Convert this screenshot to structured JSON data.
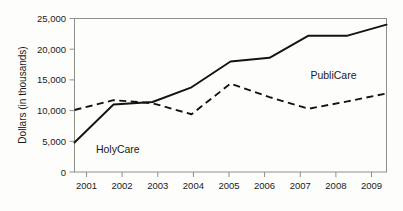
{
  "chart_data": {
    "type": "line",
    "title": "",
    "xlabel": "",
    "ylabel": "Dollars (in thousands)",
    "categories": [
      "2001",
      "2002",
      "2003",
      "2004",
      "2005",
      "2006",
      "2007",
      "2008",
      "2009"
    ],
    "x": [
      2001,
      2002,
      2003,
      2004,
      2005,
      2006,
      2007,
      2008,
      2009
    ],
    "series": [
      {
        "name": "HolyCare",
        "style": "solid",
        "color": "#15130f",
        "values": [
          4800,
          11000,
          11400,
          13800,
          18000,
          18600,
          22200,
          22200,
          24000
        ]
      },
      {
        "name": "PubliCare",
        "style": "dashed",
        "color": "#15130f",
        "values": [
          10100,
          11700,
          11200,
          9400,
          14400,
          12200,
          10300,
          11500,
          12800
        ]
      }
    ],
    "ylim": [
      0,
      25000
    ],
    "xlim": [
      2001,
      2009
    ],
    "y_ticks": [
      0,
      5000,
      10000,
      15000,
      20000,
      25000
    ],
    "y_tick_labels": [
      "0",
      "5,000",
      "10,000",
      "15,000",
      "20,000",
      "25,000"
    ],
    "grid": false,
    "legend": "inline-annotations",
    "annotations": [
      {
        "text": "HolyCare",
        "x": 2001.55,
        "y": 3100,
        "anchor": "start"
      },
      {
        "text": "PubliCare",
        "x": 2007.05,
        "y": 15100,
        "anchor": "start"
      }
    ]
  },
  "axis": {
    "y_title": "Dollars (in thousands)",
    "y_labels": [
      "25,000",
      "20,000",
      "15,000",
      "10,000",
      "5,000",
      "0"
    ],
    "x_labels": [
      "2001",
      "2002",
      "2003",
      "2004",
      "2005",
      "2006",
      "2007",
      "2008",
      "2009"
    ]
  },
  "labels": {
    "holycare": "HolyCare",
    "publicare": "PubliCare"
  },
  "colors": {
    "line": "#15130f",
    "frame": "#8f8f8a",
    "background": "#fdfdfc",
    "text": "#1a1a1a"
  }
}
